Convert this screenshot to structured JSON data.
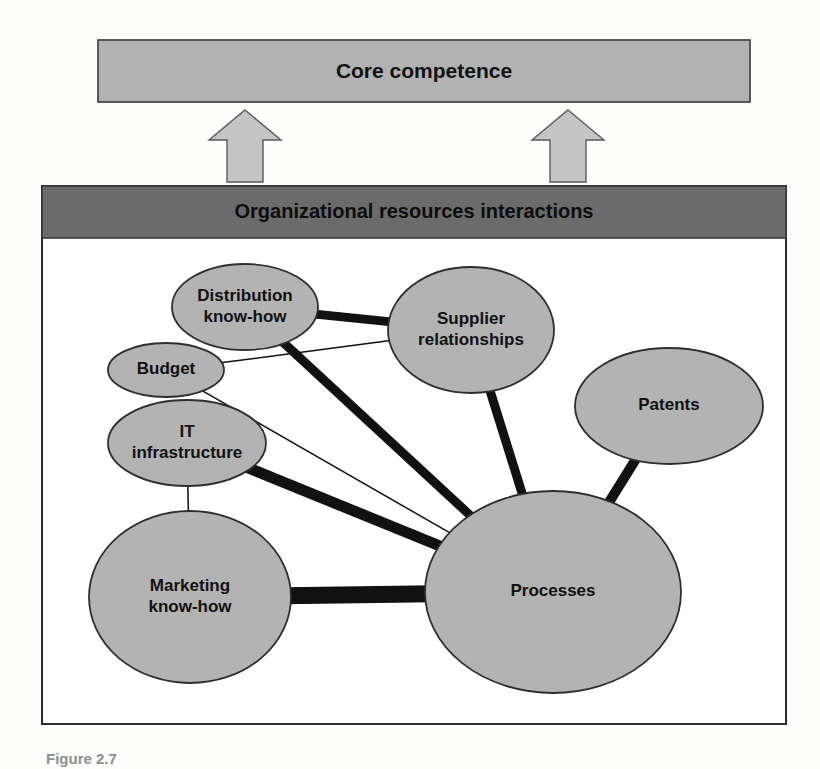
{
  "figure": {
    "background_color": "#fdfdfc",
    "caption": "Figure 2.7",
    "frame": {
      "x": 42,
      "y": 186,
      "width": 744,
      "height": 538,
      "border_color": "#2b2b2b",
      "fill_color": "#ffffff"
    }
  },
  "core_competence_bar": {
    "label": "Core competence",
    "x": 98,
    "y": 40,
    "width": 652,
    "height": 62,
    "fill_color": "#b2b2b2",
    "border_color": "#3a3a3a",
    "text_color": "#111111",
    "font_size": 21
  },
  "arrows": [
    {
      "name": "left-arrow",
      "label": "upward arrow left",
      "cx": 245,
      "tip_y": 110,
      "base_y": 182,
      "shaft_half_width": 18,
      "head_half_width": 36,
      "head_height": 30,
      "fill_color": "#c5c5c5",
      "border_color": "#5a5a5a"
    },
    {
      "name": "right-arrow",
      "label": "upward arrow right",
      "cx": 568,
      "tip_y": 110,
      "base_y": 182,
      "shaft_half_width": 18,
      "head_half_width": 36,
      "head_height": 30,
      "fill_color": "#c5c5c5",
      "border_color": "#5a5a5a"
    }
  ],
  "interactions_banner": {
    "label": "Organizational resources interactions",
    "x": 42,
    "y": 186,
    "width": 744,
    "height": 52,
    "fill_color": "#6b6b6b",
    "border_color": "#3a3a3a",
    "text_color": "#0d0d0d",
    "font_size": 20
  },
  "network": {
    "node_fill_color": "#b3b3b3",
    "node_border_color": "#2e2e2e",
    "edge_color": "#111111",
    "nodes": [
      {
        "id": "distribution",
        "label": "Distribution know-how",
        "lines": [
          "Distribution",
          "know-how"
        ],
        "cx": 245,
        "cy": 307,
        "rx": 73,
        "ry": 43,
        "font_size": 17
      },
      {
        "id": "supplier",
        "label": "Supplier relationships",
        "lines": [
          "Supplier",
          "relationships"
        ],
        "cx": 471,
        "cy": 330,
        "rx": 83,
        "ry": 63,
        "font_size": 17
      },
      {
        "id": "budget",
        "label": "Budget",
        "lines": [
          "Budget"
        ],
        "cx": 166,
        "cy": 370,
        "rx": 58,
        "ry": 27,
        "font_size": 17
      },
      {
        "id": "patents",
        "label": "Patents",
        "lines": [
          "Patents"
        ],
        "cx": 669,
        "cy": 406,
        "rx": 94,
        "ry": 58,
        "font_size": 17
      },
      {
        "id": "it",
        "label": "IT infrastructure",
        "lines": [
          "IT",
          "infrastructure"
        ],
        "cx": 187,
        "cy": 443,
        "rx": 79,
        "ry": 43,
        "font_size": 17
      },
      {
        "id": "marketing",
        "label": "Marketing know-how",
        "lines": [
          "Marketing",
          "know-how"
        ],
        "cx": 190,
        "cy": 597,
        "rx": 101,
        "ry": 86,
        "font_size": 17
      },
      {
        "id": "processes",
        "label": "Processes",
        "lines": [
          "Processes"
        ],
        "cx": 553,
        "cy": 592,
        "rx": 128,
        "ry": 101,
        "font_size": 17
      }
    ],
    "edges": [
      {
        "id": "distribution-supplier",
        "from": "distribution",
        "to": "supplier",
        "weight": "thick",
        "stroke_width": 9
      },
      {
        "id": "distribution-processes",
        "from": "distribution",
        "to": "processes",
        "weight": "thick",
        "stroke_width": 9
      },
      {
        "id": "budget-supplier",
        "from": "budget",
        "to": "supplier",
        "weight": "thin",
        "stroke_width": 1.5
      },
      {
        "id": "budget-processes",
        "from": "budget",
        "to": "processes",
        "weight": "thin",
        "stroke_width": 1.5
      },
      {
        "id": "it-processes",
        "from": "it",
        "to": "processes",
        "weight": "thick",
        "stroke_width": 11
      },
      {
        "id": "it-marketing",
        "from": "it",
        "to": "marketing",
        "weight": "thin",
        "stroke_width": 1.5
      },
      {
        "id": "supplier-processes",
        "from": "supplier",
        "to": "processes",
        "weight": "thick",
        "stroke_width": 9
      },
      {
        "id": "patents-processes",
        "from": "patents",
        "to": "processes",
        "weight": "thick",
        "stroke_width": 10
      },
      {
        "id": "marketing-processes",
        "from": "marketing",
        "to": "processes",
        "weight": "very-thick",
        "stroke_width": 17
      }
    ]
  },
  "chart_data": {
    "type": "diagram",
    "node_names": [
      "Distribution know-how",
      "Supplier relationships",
      "Budget",
      "Patents",
      "IT infrastructure",
      "Marketing know-how",
      "Processes"
    ],
    "links": [
      {
        "source": "Distribution know-how",
        "target": "Supplier relationships",
        "strength": "strong"
      },
      {
        "source": "Distribution know-how",
        "target": "Processes",
        "strength": "strong"
      },
      {
        "source": "Budget",
        "target": "Supplier relationships",
        "strength": "weak"
      },
      {
        "source": "Budget",
        "target": "Processes",
        "strength": "weak"
      },
      {
        "source": "IT infrastructure",
        "target": "Processes",
        "strength": "strong"
      },
      {
        "source": "IT infrastructure",
        "target": "Marketing know-how",
        "strength": "weak"
      },
      {
        "source": "Supplier relationships",
        "target": "Processes",
        "strength": "strong"
      },
      {
        "source": "Patents",
        "target": "Processes",
        "strength": "strong"
      },
      {
        "source": "Marketing know-how",
        "target": "Processes",
        "strength": "strongest"
      }
    ]
  }
}
